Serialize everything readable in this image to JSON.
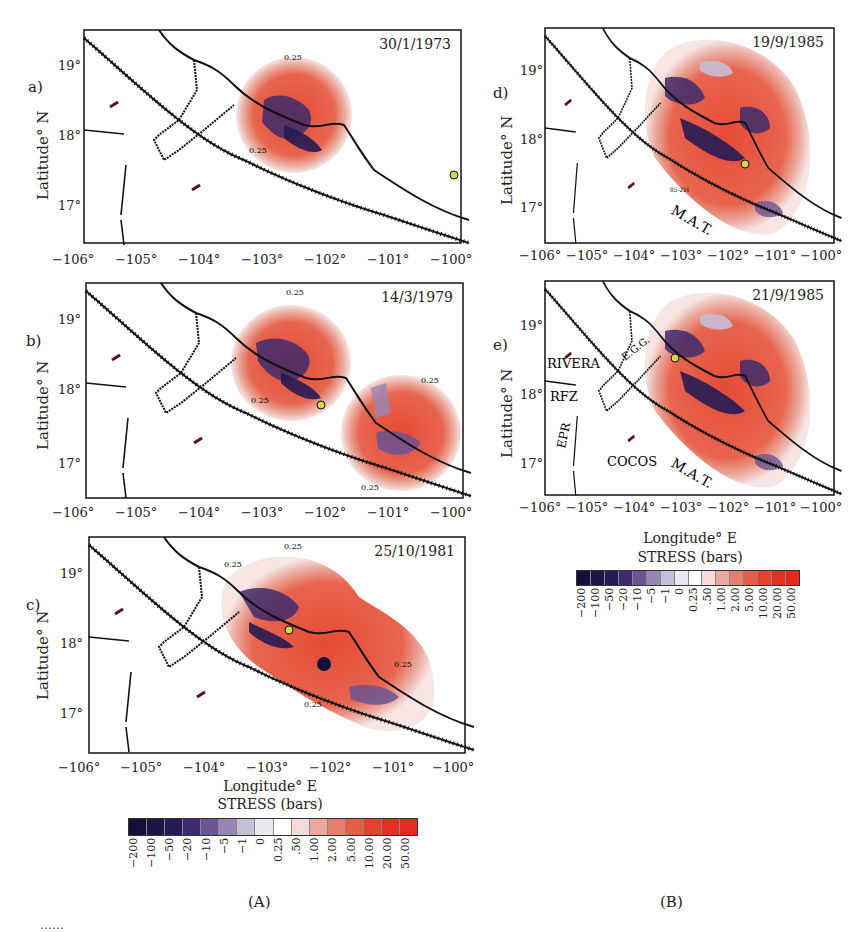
{
  "figure": {
    "axis_labels": {
      "y": "Latitude° N",
      "x": "Longitude° E"
    },
    "x_ticks": [
      "−106°",
      "−105°",
      "−104°",
      "−103°",
      "−102°",
      "−101°",
      "−100°"
    ],
    "y_ticks": [
      "19°",
      "18°",
      "17°"
    ],
    "contour_label": "0.25",
    "panels": [
      {
        "id": "a",
        "label": "a)",
        "date": "30/1/1973"
      },
      {
        "id": "b",
        "label": "b)",
        "date": "14/3/1979"
      },
      {
        "id": "c",
        "label": "c)",
        "date": "25/10/1981"
      },
      {
        "id": "d",
        "label": "d)",
        "date": "19/9/1985",
        "annotations": [
          "M.A.T.",
          "85-ZH"
        ]
      },
      {
        "id": "e",
        "label": "e)",
        "date": "21/9/1985",
        "annotations": [
          "RIVERA",
          "E.G.G.",
          "RFZ",
          "EPR",
          "COCOS",
          "M.A.T."
        ]
      }
    ],
    "colorbar": {
      "title": "STRESS (bars)",
      "labels": [
        "−200",
        "−100",
        "−50",
        "−20",
        "−10",
        "−5",
        "−1",
        "0",
        "0.25",
        ".50",
        "1.00",
        "2.00",
        "5.00",
        "10.00",
        "20.00",
        "50.00"
      ],
      "colors": [
        "#14103a",
        "#1c1648",
        "#261b55",
        "#3e2a6c",
        "#6a5492",
        "#9786b4",
        "#c7bed7",
        "#ebe8ef",
        "#ffffff",
        "#f3dcd8",
        "#eaa99d",
        "#e6806e",
        "#e55d45",
        "#e5412c",
        "#e52f22",
        "#e8281d"
      ]
    },
    "subfigure_labels": [
      "(A)",
      "(B)"
    ],
    "caption_partial": "……"
  }
}
